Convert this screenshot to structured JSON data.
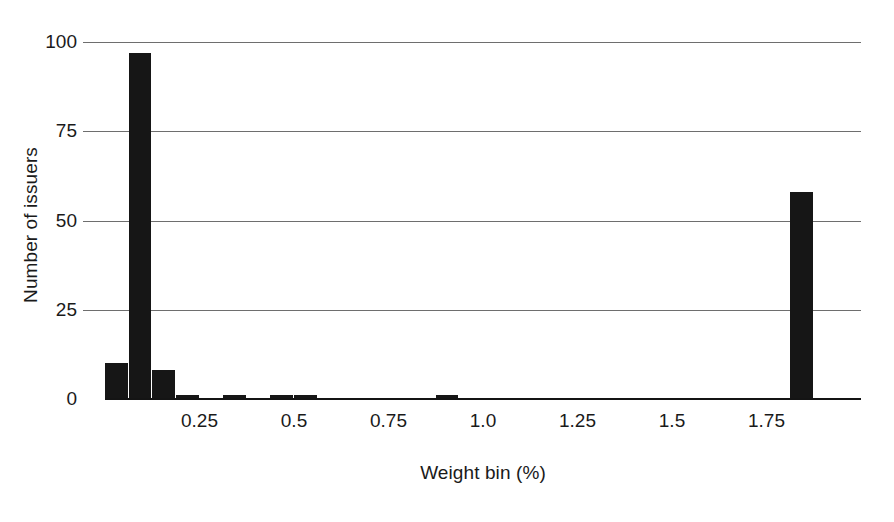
{
  "chart_data": {
    "type": "bar",
    "title": "",
    "subtitle": "",
    "xlabel": "Weight bin (%)",
    "ylabel": "Number of issuers",
    "xlim": [
      0.0,
      2.0
    ],
    "ylim": [
      0,
      100
    ],
    "grid": true,
    "legend": null,
    "yticks": [
      0,
      25,
      50,
      75,
      100
    ],
    "ytick_labels": [
      "0",
      "25",
      "50",
      "75",
      "100"
    ],
    "xticks": [
      0.25,
      0.5,
      0.75,
      1.0,
      1.25,
      1.5,
      1.75
    ],
    "xtick_labels": [
      "0.25",
      "0.5",
      "0.75",
      "1.0",
      "1.25",
      "1.5",
      "1.75"
    ],
    "bar_color": "#161616",
    "bin_width": 0.0625,
    "categories": [
      "0.00",
      "0.06",
      "0.13",
      "0.19",
      "0.25",
      "0.31",
      "0.38",
      "0.44",
      "0.50",
      "0.56",
      "0.63",
      "0.69",
      "0.75",
      "0.81",
      "0.88",
      "0.94",
      "1.00",
      "1.06",
      "1.13",
      "1.19",
      "1.25",
      "1.31",
      "1.38",
      "1.44",
      "1.50",
      "1.56",
      "1.63",
      "1.69",
      "1.75",
      "1.81",
      "1.88",
      "1.94"
    ],
    "values": [
      10,
      97,
      8,
      1,
      0,
      1,
      0,
      1,
      1,
      0,
      0,
      0,
      0,
      0,
      1,
      0,
      0,
      0,
      0,
      0,
      0,
      0,
      0,
      0,
      0,
      0,
      0,
      0,
      0,
      58,
      0,
      0
    ],
    "bars": [
      {
        "x": 0.0,
        "value": 10
      },
      {
        "x": 0.0625,
        "value": 97
      },
      {
        "x": 0.125,
        "value": 8
      },
      {
        "x": 0.1875,
        "value": 1
      },
      {
        "x": 0.3125,
        "value": 1
      },
      {
        "x": 0.4375,
        "value": 1
      },
      {
        "x": 0.5,
        "value": 1
      },
      {
        "x": 0.875,
        "value": 1
      },
      {
        "x": 1.8125,
        "value": 58
      }
    ]
  }
}
